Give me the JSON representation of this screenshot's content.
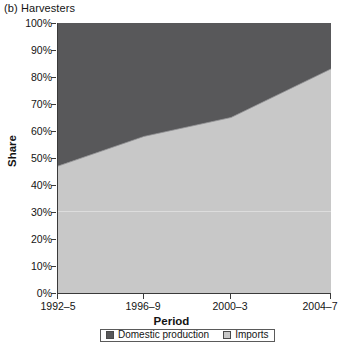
{
  "figure": {
    "panel_title": "(b) Harvesters"
  },
  "axes": {
    "y_title": "Share",
    "x_title": "Period",
    "y_ticks": [
      "0%",
      "10%",
      "20%",
      "30%",
      "40%",
      "50%",
      "60%",
      "70%",
      "80%",
      "90%",
      "100%"
    ],
    "x_ticks": [
      "1992–5",
      "1996–9",
      "2000–3",
      "2004–7"
    ]
  },
  "legend": {
    "entries": [
      {
        "label": "Domestic production",
        "color": "#58585a",
        "swatch": "legend-swatch-domestic"
      },
      {
        "label": "Imports",
        "color": "#c8c8c8",
        "swatch": "legend-swatch-imports"
      }
    ]
  },
  "chart_data": {
    "type": "area",
    "title": "(b) Harvesters",
    "xlabel": "Period",
    "ylabel": "Share",
    "categories": [
      "1992–5",
      "1996–9",
      "2000–3",
      "2004–7"
    ],
    "ylim": [
      0,
      100
    ],
    "ytick_values": [
      0,
      10,
      20,
      30,
      40,
      50,
      60,
      70,
      80,
      90,
      100
    ],
    "ytick_format": "percent",
    "stacked": true,
    "grid": false,
    "legend_position": "bottom",
    "series": [
      {
        "name": "Imports",
        "color": "#c8c8c8",
        "values": [
          47,
          58,
          65,
          83
        ]
      },
      {
        "name": "Domestic production",
        "color": "#58585a",
        "values": [
          53,
          42,
          35,
          17
        ]
      }
    ],
    "boundary_percent": [
      47,
      58,
      65,
      83
    ],
    "annotations": []
  }
}
